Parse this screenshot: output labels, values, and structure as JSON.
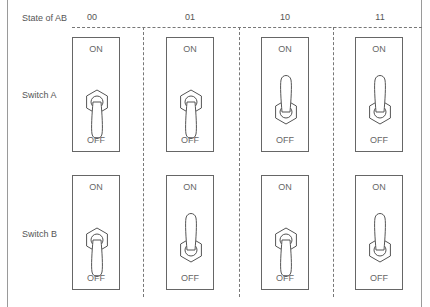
{
  "header": {
    "state_label": "State of AB"
  },
  "states": [
    "00",
    "01",
    "10",
    "11"
  ],
  "rows": [
    {
      "label": "Switch A",
      "positions": [
        "OFF",
        "OFF",
        "ON",
        "ON"
      ]
    },
    {
      "label": "Switch B",
      "positions": [
        "OFF",
        "ON",
        "OFF",
        "ON"
      ]
    }
  ],
  "switch_text": {
    "on": "ON",
    "off": "OFF"
  },
  "colors": {
    "line": "#666666",
    "text": "#555555"
  }
}
